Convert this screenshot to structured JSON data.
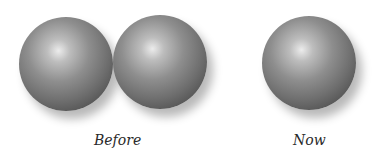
{
  "figure": {
    "panels": [
      {
        "label": "Before",
        "sphere_count": 2,
        "description": "two touching spheres"
      },
      {
        "label": "Now",
        "sphere_count": 1,
        "description": "single sphere"
      }
    ],
    "colors": {
      "sphere_highlight": "#ececec",
      "sphere_mid": "#8e8e8e",
      "sphere_edge": "#3c3c3c",
      "label_text": "#2a2a2a",
      "background": "#ffffff"
    }
  }
}
